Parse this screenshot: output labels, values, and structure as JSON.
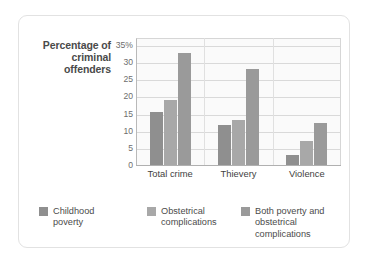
{
  "chart_data": {
    "type": "bar",
    "title": "",
    "xlabel": "",
    "ylabel": "Percentage of criminal offenders",
    "categories": [
      "Total crime",
      "Thievery",
      "Violence"
    ],
    "series": [
      {
        "name": "Childhood poverty",
        "values": [
          15.5,
          11.8,
          3.0
        ],
        "color": "#8f8f8f"
      },
      {
        "name": "Obstetrical complications",
        "values": [
          18.8,
          13.0,
          7.0
        ],
        "color": "#a8a8a8"
      },
      {
        "name": "Both poverty and obstetrical complications",
        "values": [
          32.5,
          28.0,
          12.2
        ],
        "color": "#9a9a9a"
      }
    ],
    "ylim": [
      0,
      37
    ],
    "yticks": [
      {
        "value": 35,
        "label": "35%"
      },
      {
        "value": 30,
        "label": "30"
      },
      {
        "value": 25,
        "label": "25"
      },
      {
        "value": 20,
        "label": "20"
      },
      {
        "value": 15,
        "label": "15"
      },
      {
        "value": 10,
        "label": "10"
      },
      {
        "value": 5,
        "label": "5"
      },
      {
        "value": 0,
        "label": "0"
      }
    ],
    "grid": "horizontal",
    "legend_position": "bottom"
  },
  "legend": {
    "items": [
      {
        "label": "Childhood\npoverty"
      },
      {
        "label": "Obstetrical\ncomplications"
      },
      {
        "label": "Both poverty and\nobstetrical complications"
      }
    ]
  },
  "colors": {
    "series1": "#8f8f8f",
    "series2": "#a8a8a8",
    "series3": "#9a9a9a",
    "gridline": "#d9d9d9",
    "axis": "#b0b0b0",
    "plot_bg": "#fafafa",
    "card_border": "#e2e2e2",
    "text": "#4a4a4a"
  }
}
